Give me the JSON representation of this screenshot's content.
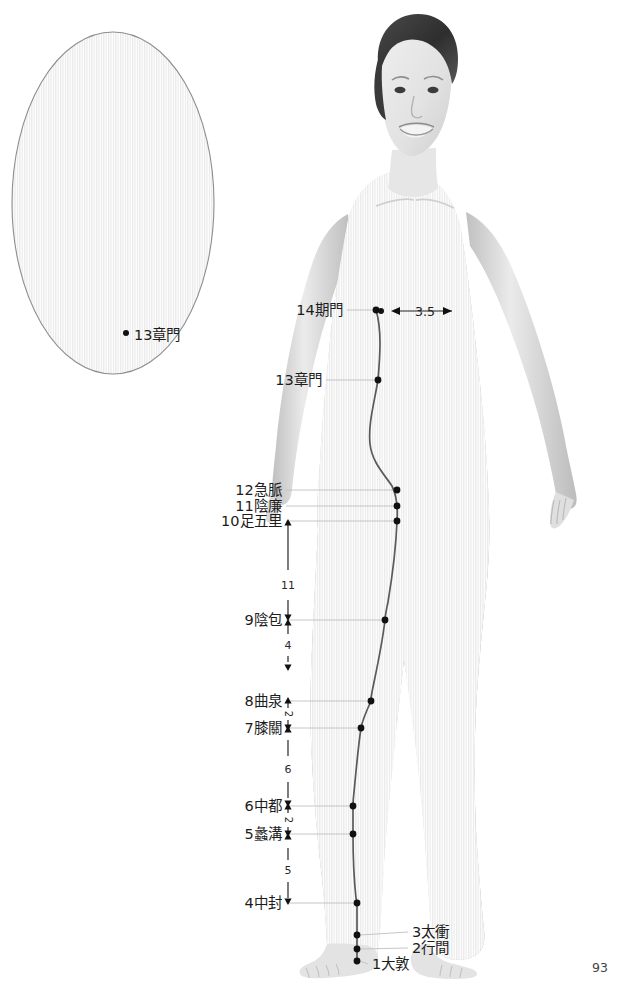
{
  "page": {
    "number": "93",
    "background": "#ffffff",
    "meridian_color": "#4a4a4a",
    "point_color": "#111111",
    "leader_color": "#b8b8b8"
  },
  "inset": {
    "name": "side-view-detail",
    "shape": "oval",
    "point_label": "13章門",
    "point_marker": "•"
  },
  "main_figure": {
    "name": "female-body-front-view",
    "description": "standing female figure, front view, grayscale halftone"
  },
  "horizontal_measure": {
    "value": "3.5",
    "left_arrow": "◀",
    "right_arrow": "▶"
  },
  "points": [
    {
      "id": 14,
      "label": "14期門",
      "side": "right",
      "x": 376,
      "y": 310,
      "label_x": 343,
      "label_y": 310
    },
    {
      "id": 13,
      "label": "13章門",
      "side": "right",
      "x": 378,
      "y": 380,
      "label_x": 322,
      "label_y": 380
    },
    {
      "id": 12,
      "label": "12急脈",
      "side": "right",
      "x": 397,
      "y": 490,
      "label_x": 282,
      "label_y": 490
    },
    {
      "id": 11,
      "label": "11陰廉",
      "side": "right",
      "x": 397,
      "y": 506,
      "label_x": 282,
      "label_y": 506
    },
    {
      "id": 10,
      "label": "10足五里",
      "side": "right",
      "x": 397,
      "y": 521,
      "label_x": 282,
      "label_y": 521
    },
    {
      "id": 9,
      "label": "9陰包",
      "side": "right",
      "x": 385,
      "y": 620,
      "label_x": 282,
      "label_y": 620
    },
    {
      "id": 8,
      "label": "8曲泉",
      "side": "right",
      "x": 371,
      "y": 701,
      "label_x": 282,
      "label_y": 701
    },
    {
      "id": 7,
      "label": "7膝關",
      "side": "right",
      "x": 361,
      "y": 728,
      "label_x": 282,
      "label_y": 728
    },
    {
      "id": 6,
      "label": "6中都",
      "side": "right",
      "x": 353,
      "y": 806,
      "label_x": 282,
      "label_y": 806
    },
    {
      "id": 5,
      "label": "5蠡溝",
      "side": "right",
      "x": 353,
      "y": 834,
      "label_x": 282,
      "label_y": 834
    },
    {
      "id": 4,
      "label": "4中封",
      "side": "right",
      "x": 357,
      "y": 903,
      "label_x": 282,
      "label_y": 903
    },
    {
      "id": 3,
      "label": "3太衝",
      "side": "left",
      "x": 357,
      "y": 935,
      "label_x": 412,
      "label_y": 932
    },
    {
      "id": 2,
      "label": "2行間",
      "side": "left",
      "x": 357,
      "y": 949,
      "label_x": 412,
      "label_y": 948
    },
    {
      "id": 1,
      "label": "1大敦",
      "side": "left",
      "x": 357,
      "y": 961,
      "label_x": 372,
      "label_y": 964
    }
  ],
  "vertical_measures": [
    {
      "value": "11",
      "x": 288,
      "y": 585,
      "rotated": false
    },
    {
      "value": "4",
      "x": 288,
      "y": 645,
      "rotated": false
    },
    {
      "value": "2",
      "x": 288,
      "y": 714,
      "rotated": true
    },
    {
      "value": "6",
      "x": 288,
      "y": 769,
      "rotated": false
    },
    {
      "value": "2",
      "x": 288,
      "y": 820,
      "rotated": true
    },
    {
      "value": "5",
      "x": 288,
      "y": 870,
      "rotated": false
    }
  ]
}
